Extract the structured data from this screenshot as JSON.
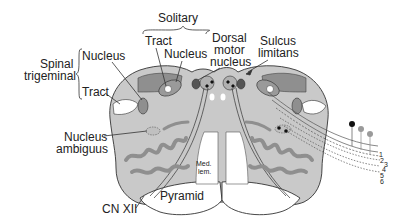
{
  "colors": {
    "tissue": "#c9c9c9",
    "dark_nucleus": "#8f8f8f",
    "darker_nucleus": "#555555",
    "outline": "#333333",
    "white_matter": "#ffffff",
    "dot": "#111111",
    "gray_dot": "#9a9a9a"
  },
  "labels": {
    "solitary": "Solitary",
    "solitary_tract": "Tract",
    "solitary_nucleus": "Nucleus",
    "dorsal_motor_1": "Dorsal",
    "dorsal_motor_2": "motor",
    "dorsal_motor_3": "nucleus",
    "sulcus_1": "Sulcus",
    "sulcus_2": "limitans",
    "spinal_1": "Spinal",
    "spinal_2": "trigeminal",
    "spinal_nucleus": "Nucleus",
    "spinal_tract": "Tract",
    "ambiguus_1": "Nucleus",
    "ambiguus_2": "ambiguus",
    "med_lem_1": "Med.",
    "med_lem_2": "lem.",
    "pyramid": "Pyramid",
    "cn_xii": "CN XII"
  },
  "fiber_numbers": [
    "1",
    "2",
    "3",
    "4",
    "5",
    "6"
  ]
}
